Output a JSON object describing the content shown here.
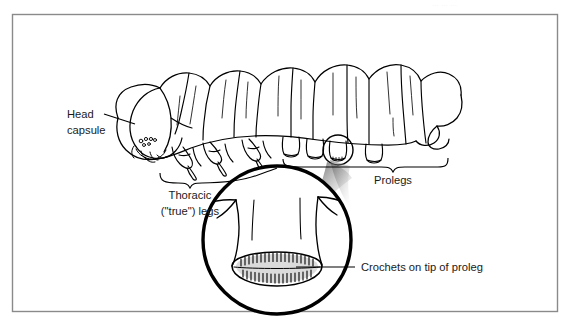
{
  "figure": {
    "title_alt": "Caterpillar (lepidopteran larva) external anatomy diagram",
    "frame": {
      "border_color": "#808080",
      "background_color": "#ffffff"
    },
    "ink_color": "#000000",
    "label_color": "#1a1a1a",
    "labels": {
      "head_capsule_line1": "Head",
      "head_capsule_line2": "capsule",
      "thoracic_line1": "Thoracic",
      "thoracic_line2": "(\"true\") legs",
      "prolegs": "Prolegs",
      "crochets": "Crochets on tip of proleg"
    },
    "callouts": [
      {
        "name": "head-capsule-callout",
        "text": "Head capsule",
        "leader": "straight-line",
        "points_to": "larval head capsule at left end of body"
      },
      {
        "name": "thoracic-legs-callout",
        "text": "Thoracic (\"true\") legs",
        "leader": "brace",
        "points_to": "three pairs of jointed clawed legs on thorax"
      },
      {
        "name": "prolegs-callout",
        "text": "Prolegs",
        "leader": "brace",
        "points_to": "fleshy abdominal prolegs along ventral abdomen"
      },
      {
        "name": "crochets-callout",
        "text": "Crochets on tip of proleg",
        "leader": "straight-line",
        "points_to": "ring of tiny hooks on planta of magnified proleg"
      }
    ],
    "magnifier": {
      "name": "proleg-magnifier-inset",
      "shape": "circle",
      "shows": "enlarged single proleg with crochets",
      "source_marker": "small circle around one proleg on body",
      "connector": "gradient wedge"
    },
    "top_edge_artifact": "… …  …"
  }
}
